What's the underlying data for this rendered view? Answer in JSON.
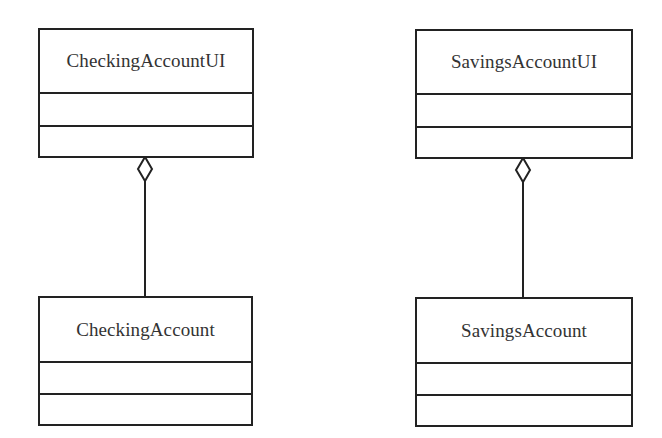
{
  "diagram": {
    "type": "uml-class-diagram",
    "classes": [
      {
        "id": "checking-account-ui",
        "name": "CheckingAccountUI",
        "attributes": [],
        "operations": []
      },
      {
        "id": "checking-account",
        "name": "CheckingAccount",
        "attributes": [],
        "operations": []
      },
      {
        "id": "savings-account-ui",
        "name": "SavingsAccountUI",
        "attributes": [],
        "operations": []
      },
      {
        "id": "savings-account",
        "name": "SavingsAccount",
        "attributes": [],
        "operations": []
      }
    ],
    "relationships": [
      {
        "type": "aggregation",
        "whole": "CheckingAccountUI",
        "part": "CheckingAccount",
        "symbol": "hollow-diamond"
      },
      {
        "type": "aggregation",
        "whole": "SavingsAccountUI",
        "part": "SavingsAccount",
        "symbol": "hollow-diamond"
      }
    ],
    "colors": {
      "line": "#222222",
      "text": "#333333",
      "background": "#ffffff"
    }
  }
}
